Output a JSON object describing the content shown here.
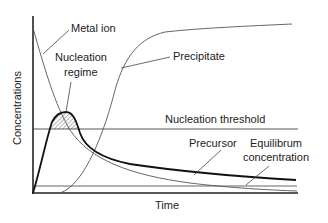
{
  "diagram": {
    "title": "",
    "axes": {
      "xlabel": "Time",
      "ylabel": "Concentrations"
    },
    "labels": {
      "metal_ion": "Metal ion",
      "nucleation_regime_line1": "Nucleation",
      "nucleation_regime_line2": "regime",
      "precipitate": "Precipitate",
      "nucleation_threshold": "Nucleation threshold",
      "precursor": "Precursor",
      "equilibrium_line1": "Equilibrum",
      "equilibrium_line2": "concentration"
    },
    "curves": [
      {
        "name": "Metal ion",
        "style": "thin gray",
        "description": "decays from high initial value toward zero"
      },
      {
        "name": "Precipitate",
        "style": "thin gray",
        "description": "sigmoidal rise to plateau"
      },
      {
        "name": "Precursor",
        "style": "thick black",
        "description": "rises to peak above nucleation threshold then decays"
      },
      {
        "name": "Nucleation threshold",
        "style": "horizontal line"
      },
      {
        "name": "Equilibrium concentration",
        "style": "horizontal line near baseline"
      }
    ],
    "colors": {
      "line": "#222222",
      "thin_line": "#555555",
      "hatch": "#444444"
    }
  }
}
